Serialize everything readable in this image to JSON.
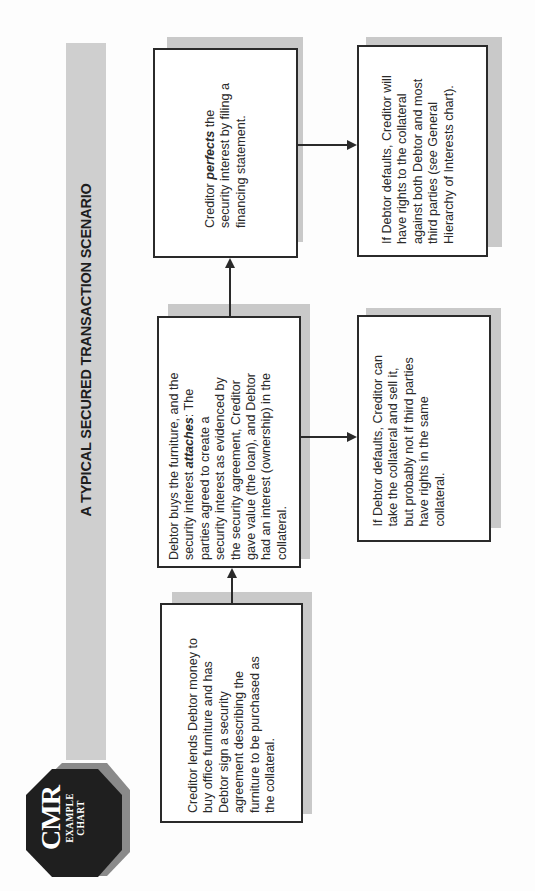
{
  "title": "A TYPICAL SECURED TRANSACTION SCENARIO",
  "badge": {
    "main": "CMR",
    "line1": "EXAMPLE",
    "line2": "CHART",
    "icon": "octagon-badge-icon"
  },
  "colors": {
    "banner": "#cfcfcf",
    "shadow": "#c9c9c9",
    "border": "#2a2a2a",
    "badge": "#1f1f1f",
    "badge_rim": "#8a8a8a"
  },
  "boxes": {
    "loan": {
      "lines": [
        "Creditor lends Debtor money to",
        "buy office furniture and has",
        "Debtor sign a security",
        "agreement describing the",
        "furniture to be purchased as",
        "the collateral."
      ]
    },
    "attach": {
      "line1_pre": "Debtor buys the furniture, and the",
      "line2_pre": "security interest ",
      "line2_em": "attaches",
      "line2_post": ": The",
      "rest": [
        "parties agreed to create a",
        "security interest as evidenced by",
        "the security agreement, Creditor",
        "gave value (the loan), and Debtor",
        "had an interest (ownership) in the",
        "collateral."
      ]
    },
    "perfect": {
      "line1_pre": "Creditor ",
      "line1_em": "perfects",
      "line1_post": " the",
      "rest": [
        "security interest by filing a",
        "financing statement."
      ]
    },
    "default_attached": {
      "lines": [
        "If Debtor defaults, Creditor can",
        "take the collateral and sell it,",
        "but probably not if third parties",
        "have rights in the same",
        "collateral."
      ]
    },
    "default_perfected": {
      "line1": "If Debtor defaults, Creditor will",
      "line2": "have rights to the collateral",
      "line3": "against both Debtor and most",
      "line4_pre": "third parties (",
      "line4_em": "see",
      "line4_post": " General",
      "line5": "Hierarchy of Interests chart)."
    }
  }
}
